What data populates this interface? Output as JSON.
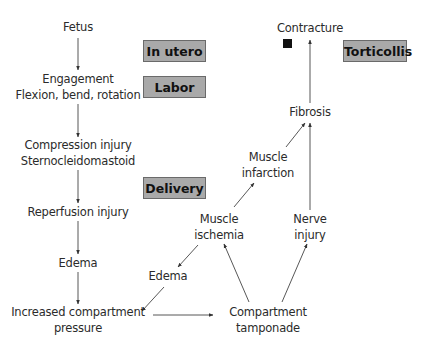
{
  "diagram": {
    "type": "flowchart",
    "stages": {
      "in_utero": "In utero",
      "labor": "Labor",
      "delivery": "Delivery",
      "torticollis": "Torticollis"
    },
    "nodes": {
      "fetus": "Fetus",
      "engagement": "Engagement",
      "flexion": "Flexion, bend, rotation",
      "compression": "Compression injury",
      "sternocleidomastoid": "Sternocleidomastoid",
      "reperfusion": "Reperfusion injury",
      "edema_left": "Edema",
      "increased_compartment": "Increased compartment",
      "pressure": "pressure",
      "edema_mid": "Edema",
      "muscle_ischemia_1": "Muscle",
      "muscle_ischemia_2": "ischemia",
      "compartment_tamponade_1": "Compartment",
      "compartment_tamponade_2": "tamponade",
      "nerve_injury_1": "Nerve",
      "nerve_injury_2": "injury",
      "muscle_infarction_1": "Muscle",
      "muscle_infarction_2": "infarction",
      "fibrosis": "Fibrosis",
      "contracture": "Contracture"
    },
    "edges": [
      [
        "Fetus",
        "Engagement / Flexion, bend, rotation"
      ],
      [
        "Engagement / Flexion, bend, rotation",
        "Compression injury / Sternocleidomastoid"
      ],
      [
        "Compression injury / Sternocleidomastoid",
        "Reperfusion injury"
      ],
      [
        "Reperfusion injury",
        "Edema"
      ],
      [
        "Edema",
        "Increased compartment pressure"
      ],
      [
        "Increased compartment pressure",
        "Compartment tamponade"
      ],
      [
        "Compartment tamponade",
        "Muscle ischemia"
      ],
      [
        "Compartment tamponade",
        "Nerve injury"
      ],
      [
        "Muscle ischemia",
        "Edema (mid)"
      ],
      [
        "Edema (mid)",
        "Increased compartment pressure"
      ],
      [
        "Muscle ischemia",
        "Muscle infarction"
      ],
      [
        "Muscle infarction",
        "Fibrosis"
      ],
      [
        "Nerve injury",
        "Fibrosis"
      ],
      [
        "Fibrosis",
        "Contracture"
      ]
    ],
    "colors": {
      "stage_fill": "#a9a9a9",
      "stage_border": "#6a6a6a",
      "text": "#2b2b2b",
      "marker": "#111111"
    }
  }
}
